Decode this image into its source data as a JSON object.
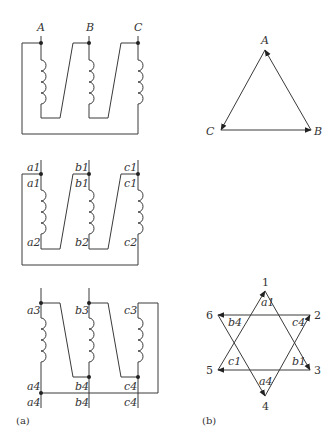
{
  "figure": {
    "caption_a": "(a)",
    "caption_b": "(b)"
  },
  "panel_a": {
    "top_winding": {
      "terminals": [
        "A",
        "B",
        "C"
      ]
    },
    "middle_winding": {
      "top_labels_outer": [
        "a1",
        "b1",
        "c1"
      ],
      "top_labels_inner": [
        "a1",
        "b1",
        "c1"
      ],
      "bottom_labels": [
        "a2",
        "b2",
        "c2"
      ]
    },
    "bottom_winding": {
      "top_labels": [
        "a3",
        "b3",
        "c3"
      ],
      "bottom_labels_inner": [
        "a4",
        "b4",
        "c4"
      ],
      "bottom_labels_outer": [
        "a4",
        "b4",
        "c4"
      ]
    }
  },
  "panel_b": {
    "triangle": {
      "vertices": [
        "A",
        "B",
        "C"
      ]
    },
    "star": {
      "points": [
        "1",
        "2",
        "3",
        "4",
        "5",
        "6"
      ],
      "edge_labels": [
        "a1",
        "c4",
        "b1",
        "a4",
        "c1",
        "b4"
      ]
    }
  }
}
